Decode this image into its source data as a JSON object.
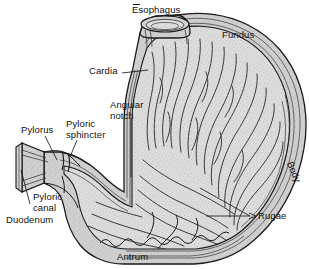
{
  "figure": {
    "type": "anatomical-illustration",
    "width": 309,
    "height": 269,
    "background_color": "#ffffff",
    "ink_color": "#111111",
    "interior_fill_color": "#d9d9d9",
    "wall_fill_color": "#c9c9c9",
    "stipple_color": "#9a9a9a"
  },
  "labels": {
    "esophagus": "Esophagus",
    "fundus": "Fundus",
    "cardia": "Cardia",
    "angular_notch_line1": "Angular",
    "angular_notch_line2": "notch",
    "pylorus": "Pylorus",
    "pyloric_sphincter_line1": "Pyloric",
    "pyloric_sphincter_line2": "sphincter",
    "pyloric_canal_line1": "Pyloric",
    "pyloric_canal_line2": "canal",
    "duodenum": "Duodenum",
    "body": "Body",
    "rugae": "Rugae",
    "antrum": "Antrum"
  },
  "structures": [
    {
      "name": "esophagus",
      "label": "Esophagus",
      "position": "top-center"
    },
    {
      "name": "fundus",
      "label": "Fundus",
      "position": "top-right"
    },
    {
      "name": "cardia",
      "label": "Cardia",
      "position": "upper-left-of-body"
    },
    {
      "name": "angular-notch",
      "label": "Angular notch",
      "position": "mid-left"
    },
    {
      "name": "pylorus",
      "label": "Pylorus",
      "position": "left"
    },
    {
      "name": "pyloric-sphincter",
      "label": "Pyloric sphincter",
      "position": "left"
    },
    {
      "name": "pyloric-canal",
      "label": "Pyloric canal",
      "position": "lower-left"
    },
    {
      "name": "duodenum",
      "label": "Duodenum",
      "position": "lower-left"
    },
    {
      "name": "body",
      "label": "Body",
      "position": "right-edge"
    },
    {
      "name": "rugae",
      "label": "Rugae",
      "position": "lower-right"
    },
    {
      "name": "antrum",
      "label": "Antrum",
      "position": "bottom-center"
    }
  ]
}
